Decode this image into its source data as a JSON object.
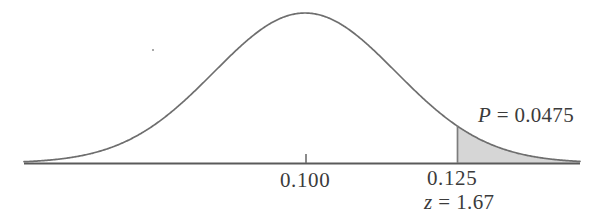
{
  "figure": {
    "labels": {
      "p_value": "P = 0.0475",
      "p_symbol": "P",
      "p_equals": " = ",
      "p_number": "0.0475",
      "mean_value": "0.100",
      "critical_value": "0.125",
      "z_symbol": "z",
      "z_equals": " = ",
      "z_number": "1.67",
      "z_label": "z = 1.67"
    },
    "colors": {
      "curve_stroke": "#6e6e6e",
      "axis_stroke": "#5a5a5a",
      "shade_fill": "#d6d6d6",
      "shade_edge": "#8a8a8a",
      "text": "#3b3b3b",
      "background": "#ffffff"
    }
  },
  "chart_data": {
    "type": "area",
    "title": "",
    "subtitle": "",
    "xlabel": "",
    "ylabel": "",
    "distribution": "normal",
    "mean": 0.1,
    "critical_x": 0.125,
    "z_score": 1.67,
    "tail": "right",
    "tail_area": 0.0475,
    "tick_labels": [
      "0.100",
      "0.125"
    ],
    "tick_x_values": [
      0.1,
      0.125
    ],
    "annotations": [
      {
        "text": "P = 0.0475",
        "x": 0.1365,
        "y": 0.3,
        "role": "tail-area-label"
      },
      {
        "text": "z = 1.67",
        "x": 0.125,
        "y": -0.22,
        "role": "z-score-label"
      }
    ],
    "grid": false,
    "legend": null,
    "xlim": [
      0.0538,
      0.1566
    ],
    "ylim": [
      0,
      1
    ],
    "pixel_geometry": {
      "baseline_y": 163,
      "baseline_x_start": 24,
      "baseline_x_end": 580,
      "peak_x": 305,
      "peak_y": 13,
      "sigma_px": 91,
      "critical_x_px": 457,
      "tick_x_px": 306,
      "tick_height_px": 9
    }
  }
}
